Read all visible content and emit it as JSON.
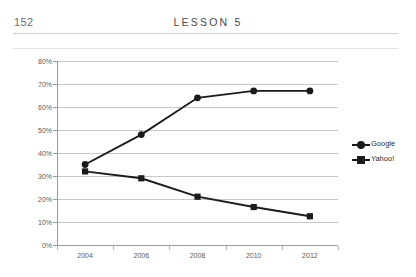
{
  "page": {
    "number": "152",
    "running_head": "LESSON 5"
  },
  "chart_data": {
    "type": "line",
    "title": "",
    "subtitle": "",
    "xlabel": "",
    "ylabel": "",
    "categories": [
      "2004",
      "2006",
      "2008",
      "2010",
      "2012"
    ],
    "x": [
      2004,
      2006,
      2008,
      2010,
      2012
    ],
    "series": [
      {
        "name": "Google",
        "marker": "circle",
        "color": "#1b1b1b",
        "values": [
          35,
          48,
          64,
          67,
          67
        ]
      },
      {
        "name": "Yahoo!",
        "marker": "square",
        "color": "#1b1b1b",
        "values": [
          32,
          29,
          21,
          16.5,
          12.5
        ]
      }
    ],
    "ylim": [
      0,
      80
    ],
    "ytick_values": [
      0,
      10,
      20,
      30,
      40,
      50,
      60,
      70,
      80
    ],
    "ytick_labels": [
      "0%",
      "10%",
      "20%",
      "30%",
      "40%",
      "50%",
      "60%",
      "70%",
      "80%"
    ],
    "xtick_labels": [
      "2004",
      "2006",
      "2008",
      "2010",
      "2012"
    ],
    "grid": "horizontal",
    "legend_position": "right",
    "legend_entries": [
      "Google",
      "Yahoo!"
    ],
    "colors": {
      "line": "#1b1b1b",
      "gridline": "#c8c8c8",
      "axis": "#9a9a9a",
      "background": "#ffffff"
    }
  }
}
